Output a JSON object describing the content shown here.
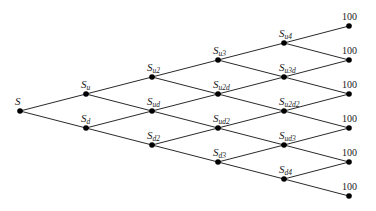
{
  "diagram": {
    "type": "binomial-tree",
    "steps": 4,
    "levels": [
      {
        "nodes": [
          {
            "base": "S",
            "sub": "",
            "sup2": ""
          }
        ]
      },
      {
        "nodes": [
          {
            "base": "S",
            "sub": "u"
          },
          {
            "base": "S",
            "sub": "d"
          }
        ]
      },
      {
        "nodes": [
          {
            "base": "S",
            "sub": "u2"
          },
          {
            "base": "S",
            "sub": "ud"
          },
          {
            "base": "S",
            "sub": "d2"
          }
        ]
      },
      {
        "nodes": [
          {
            "base": "S",
            "sub": "u3"
          },
          {
            "base": "S",
            "sub": "u2d"
          },
          {
            "base": "S",
            "sub": "ud2"
          },
          {
            "base": "S",
            "sub": "d3"
          }
        ]
      },
      {
        "nodes": [
          {
            "base": "S",
            "sub": "u4"
          },
          {
            "base": "S",
            "sub": "u3d"
          },
          {
            "base": "S",
            "sub": "u2d2"
          },
          {
            "base": "S",
            "sub": "ud3"
          },
          {
            "base": "S",
            "sub": "d4"
          }
        ]
      }
    ],
    "terminal_values": [
      "100",
      "100",
      "100",
      "100",
      "100",
      "100"
    ],
    "colors": {
      "line": "#2a2a2a",
      "node": "#000000",
      "text": "#1a1a1a"
    }
  }
}
